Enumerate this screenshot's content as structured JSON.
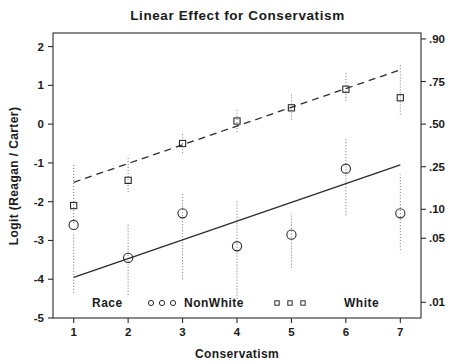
{
  "chart_data": {
    "type": "scatter",
    "title": "Linear Effect for Conservatism",
    "xlabel": "Conservatism",
    "ylabel": "Logit (Reagan / Carter)",
    "y2label": "",
    "grid": false,
    "legend_position": "bottom-inside",
    "xlim": [
      0.62,
      7.38
    ],
    "ylim": [
      -5,
      2.35
    ],
    "x": [
      1,
      2,
      3,
      4,
      5,
      6,
      7
    ],
    "xticks": [
      "1",
      "2",
      "3",
      "4",
      "5",
      "6",
      "7"
    ],
    "yticks": [
      "2",
      "1",
      "0",
      "-1",
      "-2",
      "-3",
      "-4",
      "-5"
    ],
    "ytick_values": [
      2,
      1,
      0,
      -1,
      -2,
      -3,
      -4,
      -5
    ],
    "y2ticks": [
      ".90",
      ".75",
      ".50",
      ".25",
      ".10",
      ".05",
      ".01"
    ],
    "y2tick_values": [
      2.197,
      1.099,
      0.0,
      -1.099,
      -2.197,
      -2.944,
      -4.595
    ],
    "legend": {
      "group_label": "Race",
      "entries": [
        {
          "name": "NonWhite",
          "marker": "circle",
          "line": "solid"
        },
        {
          "name": "White",
          "marker": "square",
          "line": "dashed"
        }
      ]
    },
    "series": [
      {
        "name": "NonWhite",
        "marker": "circle",
        "line_style": "solid",
        "color": "#2b2b2b",
        "values": [
          -2.6,
          -3.45,
          -2.3,
          -3.15,
          -2.85,
          -1.15,
          -2.3
        ],
        "error_low": [
          -4.35,
          -4.4,
          -4.0,
          -4.5,
          -3.7,
          -2.35,
          -3.25
        ],
        "error_high": [
          -2.85,
          -2.55,
          -1.8,
          -1.95,
          -2.3,
          -0.35,
          -1.3
        ],
        "fit_endpoints": [
          -3.95,
          -1.05
        ]
      },
      {
        "name": "White",
        "marker": "square",
        "line_style": "dashed",
        "color": "#2b2b2b",
        "values": [
          -2.1,
          -1.45,
          -0.5,
          0.08,
          0.42,
          0.9,
          0.68
        ],
        "error_low": [
          -2.55,
          -1.75,
          -0.75,
          -0.2,
          0.12,
          0.6,
          0.25
        ],
        "error_high": [
          -1.0,
          -0.85,
          -0.25,
          0.38,
          0.78,
          1.35,
          1.55
        ],
        "fit_endpoints": [
          -1.5,
          1.4
        ]
      }
    ]
  }
}
